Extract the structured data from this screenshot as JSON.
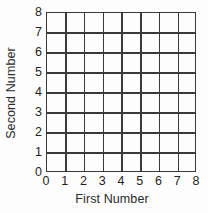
{
  "chart_data": {
    "type": "table",
    "title": "",
    "subtitle": "",
    "xlabel": "First Number",
    "ylabel": "Second Number",
    "xlim": [
      0,
      8
    ],
    "ylim": [
      0,
      8
    ],
    "xticks": [
      "0",
      "1",
      "2",
      "3",
      "4",
      "5",
      "6",
      "7",
      "8"
    ],
    "yticks": [
      "8",
      "7",
      "6",
      "5",
      "4",
      "3",
      "2",
      "1",
      "0"
    ],
    "xtick_values": [
      0,
      1,
      2,
      3,
      4,
      5,
      6,
      7,
      8
    ],
    "ytick_values": [
      8,
      7,
      6,
      5,
      4,
      3,
      2,
      1,
      0
    ],
    "grid": true,
    "grid_rows": 8,
    "grid_cols": 8,
    "legend": null,
    "series": [],
    "annotations": [],
    "colors": {
      "grid_line": "#3a3a3a",
      "cell_fill": "#fdfdfd",
      "text": "#1f1f1f",
      "axis_title": "#2b2b2b",
      "background": "#ffffff"
    }
  },
  "axes": {
    "y": {
      "title": "Second Number",
      "ticks": [
        {
          "label": "8",
          "value": 8
        },
        {
          "label": "7",
          "value": 7
        },
        {
          "label": "6",
          "value": 6
        },
        {
          "label": "5",
          "value": 5
        },
        {
          "label": "4",
          "value": 4
        },
        {
          "label": "3",
          "value": 3
        },
        {
          "label": "2",
          "value": 2
        },
        {
          "label": "1",
          "value": 1
        },
        {
          "label": "0",
          "value": 0
        }
      ]
    },
    "x": {
      "title": "First Number",
      "ticks": [
        {
          "label": "0",
          "value": 0
        },
        {
          "label": "1",
          "value": 1
        },
        {
          "label": "2",
          "value": 2
        },
        {
          "label": "3",
          "value": 3
        },
        {
          "label": "4",
          "value": 4
        },
        {
          "label": "5",
          "value": 5
        },
        {
          "label": "6",
          "value": 6
        },
        {
          "label": "7",
          "value": 7
        },
        {
          "label": "8",
          "value": 8
        }
      ]
    }
  }
}
